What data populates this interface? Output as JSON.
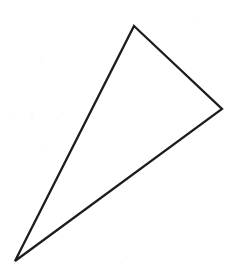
{
  "figure": {
    "title": "Triangle outline",
    "shape_type": "triangle",
    "filled": false,
    "canvas": {
      "width": 249,
      "height": 277,
      "background_color": "#ffffff"
    },
    "stroke": {
      "color": "#1d1d1d",
      "width": 2.3,
      "linejoin": "miter",
      "linecap": "round"
    },
    "vertices": [
      {
        "name": "top-apex",
        "x": 134,
        "y": 26
      },
      {
        "name": "right-vertex",
        "x": 222,
        "y": 109
      },
      {
        "name": "bottom-left-tip",
        "x": 15,
        "y": 261
      }
    ],
    "points_attr": "134,26 222,109 15,261",
    "edges": [
      {
        "name": "top-right-edge",
        "from": "top-apex",
        "to": "right-vertex"
      },
      {
        "name": "lower-right-edge",
        "from": "right-vertex",
        "to": "bottom-left-tip"
      },
      {
        "name": "left-edge",
        "from": "bottom-left-tip",
        "to": "top-apex"
      }
    ],
    "specks": [
      {
        "x": 40,
        "y": 60,
        "size": 3
      },
      {
        "x": 55,
        "y": 57,
        "size": 2
      },
      {
        "x": 12,
        "y": 118,
        "size": 3
      },
      {
        "x": 30,
        "y": 115,
        "size": 4
      },
      {
        "x": 62,
        "y": 112,
        "size": 3
      },
      {
        "x": 46,
        "y": 145,
        "size": 3
      },
      {
        "x": 196,
        "y": 18,
        "size": 3
      },
      {
        "x": 231,
        "y": 150,
        "size": 3
      },
      {
        "x": 120,
        "y": 262,
        "size": 3
      },
      {
        "x": 168,
        "y": 250,
        "size": 2
      }
    ]
  }
}
